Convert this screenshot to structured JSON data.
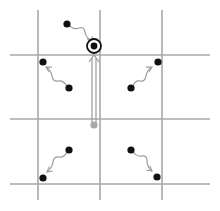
{
  "diagram": {
    "colors": {
      "grid": "#a8a8a8",
      "particle": "#111111",
      "ghost_particle": "#a8a8a8",
      "wavy_arrow": "#9a9a9a",
      "target_ring": "#111111"
    },
    "grid": {
      "vertical_x": [
        38,
        100,
        162
      ],
      "horizontal_y": [
        55,
        119,
        184
      ]
    },
    "target": {
      "x": 94,
      "y": 46,
      "label": "target-site"
    },
    "source_ghost": {
      "x": 94,
      "y": 125
    },
    "particles": [
      {
        "from": [
          67,
          24
        ],
        "to": [
          94,
          46
        ],
        "name": "top-particle"
      },
      {
        "from": [
          69,
          88
        ],
        "to": [
          43,
          62
        ],
        "name": "upper-left-particle"
      },
      {
        "from": [
          131,
          88
        ],
        "to": [
          158,
          62
        ],
        "name": "upper-right-particle"
      },
      {
        "from": [
          69,
          150
        ],
        "to": [
          43,
          178
        ],
        "name": "lower-left-particle"
      },
      {
        "from": [
          131,
          150
        ],
        "to": [
          157,
          177
        ],
        "name": "lower-right-particle"
      }
    ]
  }
}
